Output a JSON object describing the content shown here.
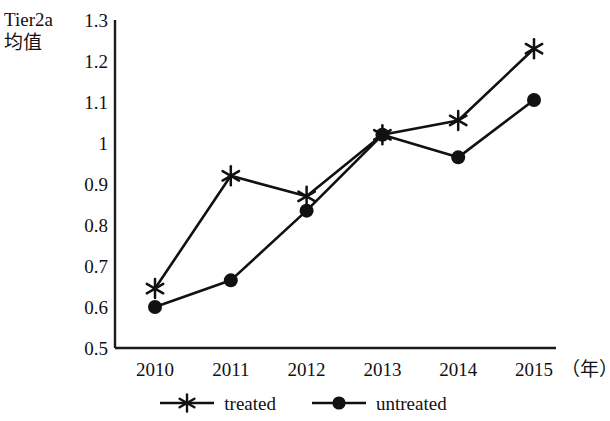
{
  "chart_data": {
    "type": "line",
    "title": "",
    "ylabel": "Tier2a\n均值",
    "xlabel": "（年）",
    "categories": [
      "2010",
      "2011",
      "2012",
      "2013",
      "2014",
      "2015"
    ],
    "x": [
      2010,
      2011,
      2012,
      2013,
      2014,
      2015
    ],
    "ylim": [
      0.5,
      1.3
    ],
    "yticks": [
      "1.3",
      "1.2",
      "1.1",
      "1",
      "0.9",
      "0.8",
      "0.7",
      "0.6",
      "0.5"
    ],
    "ytick_values": [
      1.3,
      1.2,
      1.1,
      1.0,
      0.9,
      0.8,
      0.7,
      0.6,
      0.5
    ],
    "grid": false,
    "legend_position": "bottom",
    "series": [
      {
        "name": "treated",
        "marker": "asterisk",
        "color": "#111111",
        "values": [
          0.645,
          0.92,
          0.87,
          1.02,
          1.055,
          1.23
        ]
      },
      {
        "name": "untreated",
        "marker": "filled-circle",
        "color": "#111111",
        "values": [
          0.6,
          0.665,
          0.835,
          1.02,
          0.965,
          1.105
        ]
      }
    ]
  },
  "legend": {
    "entries": [
      {
        "label": "treated"
      },
      {
        "label": "untreated"
      }
    ]
  },
  "colors": {
    "line": "#111111",
    "axis": "#1a1a1a",
    "background": "#ffffff"
  }
}
